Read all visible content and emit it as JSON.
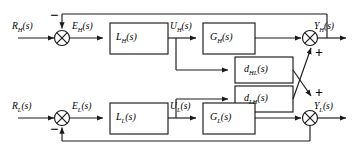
{
  "diagram": {
    "type": "control-block-diagram",
    "stroke_color": "#1a1a1a",
    "block_fill": "#ffffff",
    "background": "#ffffff"
  },
  "loops": {
    "upper": {
      "reference_label": "R",
      "reference_sub": "H",
      "error_label": "E",
      "error_sub": "H",
      "controller_label": "L",
      "controller_sub": "H",
      "control_label": "U",
      "control_sub": "H",
      "plant_label": "G",
      "plant_sub": "H",
      "output_label": "Y",
      "output_sub": "H",
      "suffix": "(s)",
      "feedback_sign": "−",
      "sum_sign": "+"
    },
    "lower": {
      "reference_label": "R",
      "reference_sub": "L",
      "error_label": "E",
      "error_sub": "L",
      "controller_label": "L",
      "controller_sub": "L",
      "control_label": "U",
      "control_sub": "L",
      "plant_label": "G",
      "plant_sub": "L",
      "output_label": "Y",
      "output_sub": "L",
      "suffix": "(s)",
      "feedback_sign": "−",
      "sum_sign": "+"
    }
  },
  "coupling": {
    "upper_block": {
      "label": "d",
      "sub": "HL",
      "suffix": "(s)",
      "description": "cross coupling from upper control signal to lower output sum"
    },
    "lower_block": {
      "label": "d",
      "sub": "LH",
      "suffix": "(s)",
      "description": "cross coupling from lower control signal to upper output sum"
    }
  },
  "junctions": {
    "upper_error": "circle-cross-sum",
    "upper_output": "circle-cross-sum",
    "lower_error": "circle-cross-sum",
    "lower_output": "circle-cross-sum"
  }
}
